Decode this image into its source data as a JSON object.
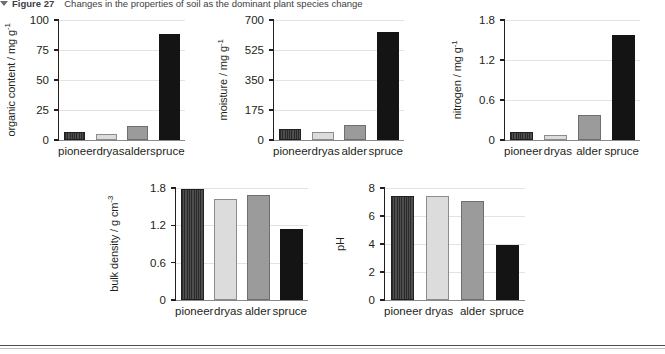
{
  "caption": {
    "marker": "triangle-down-icon",
    "label": "Figure 27",
    "text": "Changes in the properties of soil as the dominant plant species change"
  },
  "categories": [
    "pioneer",
    "dryas",
    "alder",
    "spruce"
  ],
  "bar_styles": [
    "hatched",
    "light",
    "mid",
    "dark"
  ],
  "colors": {
    "pioneer": "#3b3b3b",
    "dryas": "#dcdcdc",
    "alder": "#9b9b9b",
    "spruce": "#141414",
    "axis": "#231f20",
    "grid": "#e3e3e3"
  },
  "chart_data": [
    {
      "id": "organic-content",
      "type": "bar",
      "title": "",
      "ylabel": "organic content / mg g",
      "ylabel_sup": "-1",
      "xlabel": "",
      "categories": [
        "pioneer",
        "dryas",
        "alder",
        "spruce"
      ],
      "values": [
        7,
        5,
        12,
        88
      ],
      "ylim": [
        0,
        100
      ],
      "ticks": [
        0,
        25,
        50,
        75,
        100
      ],
      "ticklabels": [
        "0",
        "25",
        "50",
        "75",
        "100"
      ],
      "grid": true
    },
    {
      "id": "moisture",
      "type": "bar",
      "title": "",
      "ylabel": "moisture / mg g",
      "ylabel_sup": "-1",
      "xlabel": "",
      "categories": [
        "pioneer",
        "dryas",
        "alder",
        "spruce"
      ],
      "values": [
        62,
        45,
        88,
        630
      ],
      "ylim": [
        0,
        700
      ],
      "ticks": [
        0,
        175,
        350,
        525,
        700
      ],
      "ticklabels": [
        "0",
        "175",
        "350",
        "525",
        "700"
      ],
      "grid": true
    },
    {
      "id": "nitrogen",
      "type": "bar",
      "title": "",
      "ylabel": "nitrogen / mg g",
      "ylabel_sup": "-1",
      "xlabel": "",
      "categories": [
        "pioneer",
        "dryas",
        "alder",
        "spruce"
      ],
      "values": [
        0.12,
        0.08,
        0.38,
        1.57
      ],
      "ylim": [
        0,
        1.8
      ],
      "ticks": [
        0,
        0.6,
        1.2,
        1.8
      ],
      "ticklabels": [
        "0",
        "0.6",
        "1.2",
        "1.8"
      ],
      "grid": true
    },
    {
      "id": "bulk-density",
      "type": "bar",
      "title": "",
      "ylabel": "bulk density / g cm",
      "ylabel_sup": "-3",
      "xlabel": "",
      "categories": [
        "pioneer",
        "dryas",
        "alder",
        "spruce"
      ],
      "values": [
        1.78,
        1.63,
        1.69,
        1.14
      ],
      "ylim": [
        0,
        1.8
      ],
      "ticks": [
        0,
        0.6,
        1.2,
        1.8
      ],
      "ticklabels": [
        "0",
        "0.6",
        "1.2",
        "1.8"
      ],
      "grid": true
    },
    {
      "id": "ph",
      "type": "bar",
      "title": "",
      "ylabel": "pH",
      "ylabel_sup": "",
      "xlabel": "",
      "categories": [
        "pioneer",
        "dryas",
        "alder",
        "spruce"
      ],
      "values": [
        7.4,
        7.45,
        7.1,
        3.9
      ],
      "ylim": [
        0,
        8
      ],
      "ticks": [
        0,
        2,
        4,
        6,
        8
      ],
      "ticklabels": [
        "0",
        "2",
        "4",
        "6",
        "8"
      ],
      "grid": true
    }
  ]
}
